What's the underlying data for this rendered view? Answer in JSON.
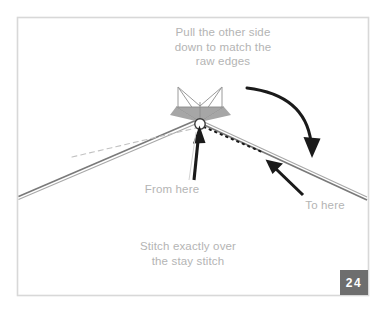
{
  "illustration": {
    "title": "Sewing instruction diagram - matching raw edges over stay stitch",
    "background_color": "#ffffff",
    "border_color": "#d8d8d8",
    "captions": {
      "top": "Pull the other side\ndown to match the\nraw edges",
      "from_here": "From here",
      "to_here": "To here",
      "bottom": "Stitch exactly over\nthe stay stitch"
    },
    "caption_color": "#b4b4b4",
    "page_badge": {
      "number": "24",
      "background_color": "#6e6e6e",
      "text_color": "#ffffff"
    },
    "graphics": {
      "fabric_fold_color": "#7a7a7a",
      "fabric_line_color": "#999999",
      "shaded_triangle_fill": "#a6a6a6",
      "shaded_triangle_stroke": "#8a8a8a",
      "wing_outline_color": "#9a9a9a",
      "stitch_dot_color": "#1a1a1a",
      "guide_dash_color": "#bcbcbc",
      "arrow_color": "#1a1a1a",
      "stitch_point_fill": "#ffffff",
      "elements": [
        "shaded-bowtie-triangle",
        "wing-outlines",
        "left-fabric-edge",
        "right-fabric-edge",
        "light-dashed-guide-line",
        "dark-dotted-stitch-line",
        "stitch-point-circle",
        "vertical-from-here-arrow",
        "diagonal-to-here-arrow",
        "curved-pull-down-arrow"
      ]
    }
  }
}
